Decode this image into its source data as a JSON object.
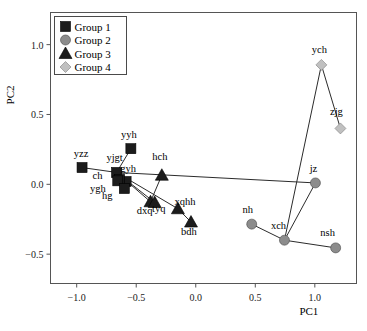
{
  "chart_data": {
    "type": "scatter",
    "title": "",
    "xlabel": "PC1",
    "ylabel": "PC2",
    "xlim": [
      -1.22,
      1.35
    ],
    "ylim": [
      -0.71,
      1.23
    ],
    "xticks": [
      -1.0,
      -0.5,
      0.0,
      0.5,
      1.0
    ],
    "xticklabels": [
      "−1.0",
      "−0.5",
      "0.0",
      "0.5",
      "1.0"
    ],
    "yticks": [
      1.0,
      0.5,
      0.0,
      -0.5
    ],
    "yticklabels": [
      "1.0",
      "0.5",
      "0.0",
      "−0.5"
    ],
    "grid": false,
    "legend_position": "upper-left",
    "legend": [
      {
        "label": "Group 1",
        "marker": "square",
        "color": "#1c1c1c"
      },
      {
        "label": "Group 2",
        "marker": "circle",
        "color": "#8c8c8c"
      },
      {
        "label": "Group 3",
        "marker": "triangle",
        "color": "#1c1c1c"
      },
      {
        "label": "Group 4",
        "marker": "diamond",
        "color": "#c0c0c0"
      }
    ],
    "series": [
      {
        "name": "Group 1",
        "marker": "square",
        "color": "#1c1c1c",
        "points": [
          {
            "label": "yzz",
            "x": -0.955,
            "y": 0.12,
            "label_dx": -1,
            "label_dy": -9
          },
          {
            "label": "yjgt",
            "x": -0.665,
            "y": 0.085,
            "label_dx": -2,
            "label_dy": -9
          },
          {
            "label": "yyh",
            "x": -0.545,
            "y": 0.255,
            "label_dx": -2,
            "label_dy": -9
          },
          {
            "label": "gyh",
            "x": -0.585,
            "y": 0.02,
            "label_dx": 2,
            "label_dy": -8
          },
          {
            "label": "ch",
            "x": -0.64,
            "y": 0.035,
            "label_dx": -22,
            "label_dy": 2
          },
          {
            "label": "ygh",
            "x": -0.655,
            "y": 0.025,
            "label_dx": -20,
            "label_dy": 13
          },
          {
            "label": "hg",
            "x": -0.6,
            "y": -0.03,
            "label_dx": -17,
            "label_dy": 12
          }
        ]
      },
      {
        "name": "Group 2",
        "marker": "circle",
        "color": "#8c8c8c",
        "points": [
          {
            "label": "jz",
            "x": 1.005,
            "y": 0.01,
            "label_dx": -2,
            "label_dy": -9
          },
          {
            "label": "nh",
            "x": 0.47,
            "y": -0.285,
            "label_dx": -4,
            "label_dy": -9
          },
          {
            "label": "xch",
            "x": 0.745,
            "y": -0.4,
            "label_dx": -6,
            "label_dy": -9
          },
          {
            "label": "nsh",
            "x": 1.175,
            "y": -0.455,
            "label_dx": -8,
            "label_dy": -10
          }
        ]
      },
      {
        "name": "Group 3",
        "marker": "triangle",
        "color": "#1c1c1c",
        "points": [
          {
            "label": "hch",
            "x": -0.285,
            "y": 0.065,
            "label_dx": -2,
            "label_dy": -13
          },
          {
            "label": "dxq",
            "x": -0.38,
            "y": -0.125,
            "label_dx": -6,
            "label_dy": 14
          },
          {
            "label": "tyq",
            "x": -0.345,
            "y": -0.13,
            "label_dx": 4,
            "label_dy": 12
          },
          {
            "label": "bdh",
            "x": -0.04,
            "y": -0.27,
            "label_dx": -2,
            "label_dy": 15
          },
          {
            "label": "xqhh",
            "x": -0.15,
            "y": -0.175,
            "label_dx": 7,
            "label_dy": -2
          }
        ]
      },
      {
        "name": "Group 4",
        "marker": "diamond",
        "color": "#c0c0c0",
        "points": [
          {
            "label": "ych",
            "x": 1.055,
            "y": 0.855,
            "label_dx": -2,
            "label_dy": -10
          },
          {
            "label": "zjg",
            "x": 1.215,
            "y": 0.4,
            "label_dx": -4,
            "label_dy": -11
          }
        ]
      }
    ],
    "connections": [
      [
        "yzz",
        "yjgt"
      ],
      [
        "yyh",
        "yjgt"
      ],
      [
        "gyh",
        "yjgt"
      ],
      [
        "ch",
        "yjgt"
      ],
      [
        "ygh",
        "yjgt"
      ],
      [
        "hg",
        "yjgt"
      ],
      [
        "yjgt",
        "dxq"
      ],
      [
        "yjgt",
        "tyq"
      ],
      [
        "yjgt",
        "xqhh"
      ],
      [
        "yjgt",
        "jz"
      ],
      [
        "hch",
        "dxq"
      ],
      [
        "dxq",
        "tyq"
      ],
      [
        "xqhh",
        "bdh"
      ],
      [
        "jz",
        "xch"
      ],
      [
        "nh",
        "xch"
      ],
      [
        "xch",
        "nsh"
      ],
      [
        "ych",
        "zjg"
      ],
      [
        "ych",
        "xch"
      ]
    ]
  }
}
